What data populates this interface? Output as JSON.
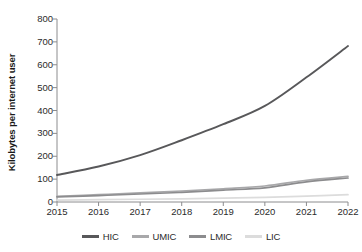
{
  "chart_data": {
    "type": "line",
    "title": "",
    "xlabel": "",
    "ylabel": "Kilobytes per internet user",
    "x": [
      2015,
      2016,
      2017,
      2018,
      2019,
      2020,
      2021,
      2022
    ],
    "xticklabels": [
      "2015",
      "2016",
      "2017",
      "2018",
      "2019",
      "2020",
      "2021",
      "2022"
    ],
    "yticklabels": [
      "0",
      "100",
      "200",
      "300",
      "400",
      "500",
      "600",
      "700",
      "800"
    ],
    "yticks": [
      0,
      100,
      200,
      300,
      400,
      500,
      600,
      700,
      800
    ],
    "ylim": [
      0,
      800
    ],
    "xlim": [
      2015,
      2022
    ],
    "grid": false,
    "legend_position": "bottom",
    "series": [
      {
        "name": "HIC",
        "color": "#58585a",
        "values": [
          118,
          155,
          205,
          270,
          340,
          420,
          545,
          682
        ]
      },
      {
        "name": "UMIC",
        "color": "#a8a8aa",
        "values": [
          25,
          32,
          40,
          48,
          58,
          70,
          95,
          112
        ]
      },
      {
        "name": "LMIC",
        "color": "#8c8c8e",
        "values": [
          22,
          28,
          35,
          42,
          52,
          62,
          88,
          105
        ]
      },
      {
        "name": "LIC",
        "color": "#dcdcdc",
        "values": [
          8,
          10,
          12,
          14,
          17,
          20,
          26,
          32
        ]
      }
    ]
  },
  "axis": {
    "y_title": "Kilobytes per internet user",
    "axis_color": "#8c8c8e"
  },
  "legend": {
    "items": [
      {
        "label": "HIC"
      },
      {
        "label": "UMIC"
      },
      {
        "label": "LMIC"
      },
      {
        "label": "LIC"
      }
    ]
  }
}
